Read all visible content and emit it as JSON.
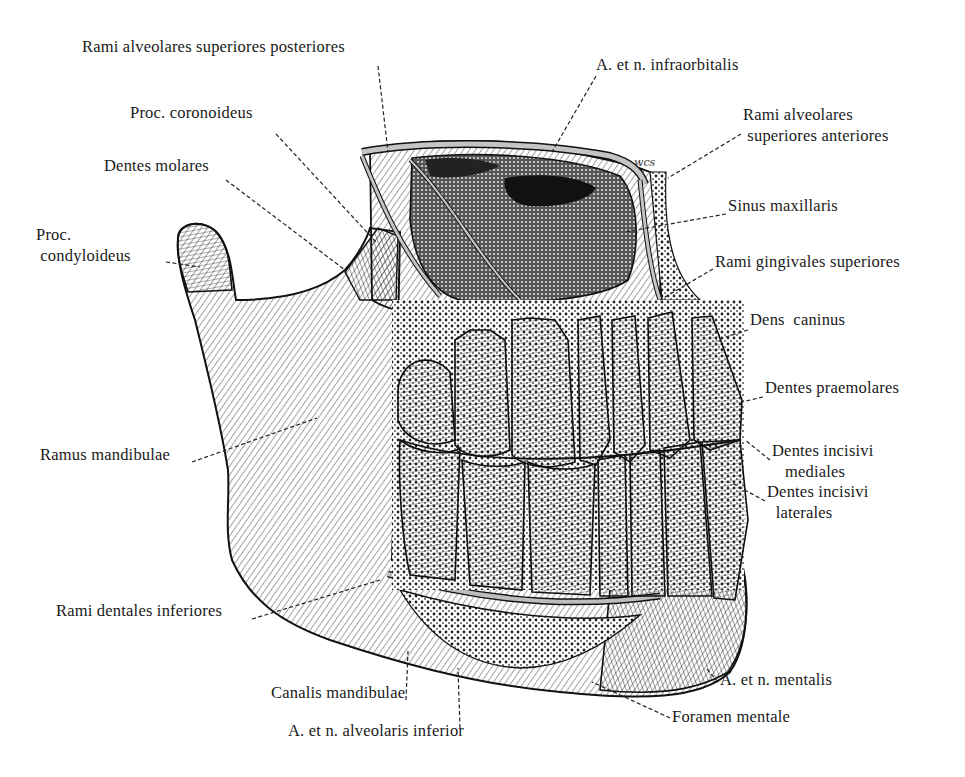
{
  "figure": {
    "signature": "wcs",
    "colors": {
      "ink": "#1a1a1a",
      "background": "#ffffff",
      "vessel_fill": "#bdbdbd",
      "bone_dark": "#2a2a2a"
    }
  },
  "labels": [
    {
      "id": "rami-alveolares-superiores-posteriores",
      "text": "Rami alveolares superiores posteriores",
      "x": 82,
      "y": 44,
      "lx1": 378,
      "ly1": 66,
      "lx2": 388,
      "ly2": 152
    },
    {
      "id": "a-et-n-infraorbitalis",
      "text": "A. et n. infraorbitalis",
      "x": 596,
      "y": 62,
      "lx1": 596,
      "ly1": 76,
      "lx2": 552,
      "ly2": 152
    },
    {
      "id": "proc-coronoideus",
      "text": "Proc. coronoideus",
      "x": 130,
      "y": 110,
      "lx1": 276,
      "ly1": 134,
      "lx2": 376,
      "ly2": 242
    },
    {
      "id": "rami-alveolares-superiores-anteriores",
      "text": "Rami alveolares\n superiores anteriores",
      "x": 743,
      "y": 112,
      "lx1": 741,
      "ly1": 134,
      "lx2": 668,
      "ly2": 178
    },
    {
      "id": "dentes-molares",
      "text": "Dentes molares",
      "x": 104,
      "y": 163,
      "lx1": 226,
      "ly1": 180,
      "lx2": 345,
      "ly2": 270
    },
    {
      "id": "sinus-maxillaris",
      "text": "Sinus maxillaris",
      "x": 728,
      "y": 203,
      "lx1": 726,
      "ly1": 214,
      "lx2": 625,
      "ly2": 232
    },
    {
      "id": "proc-condyloideus",
      "text": "Proc.\n condyloideus",
      "x": 36,
      "y": 232,
      "lx1": 166,
      "ly1": 262,
      "lx2": 200,
      "ly2": 267
    },
    {
      "id": "rami-gingivales-superiores",
      "text": "Rami gingivales superiores",
      "x": 715,
      "y": 259,
      "lx1": 713,
      "ly1": 269,
      "lx2": 660,
      "ly2": 300
    },
    {
      "id": "dens-caninus",
      "text": "Dens  caninus",
      "x": 750,
      "y": 317,
      "lx1": 748,
      "ly1": 330,
      "lx2": 716,
      "ly2": 340
    },
    {
      "id": "dentes-praemolares",
      "text": "Dentes praemolares",
      "x": 765,
      "y": 385,
      "lx1": 763,
      "ly1": 397,
      "lx2": 742,
      "ly2": 402
    },
    {
      "id": "ramus-mandibulae",
      "text": "Ramus mandibulae",
      "x": 40,
      "y": 452,
      "lx1": 192,
      "ly1": 462,
      "lx2": 317,
      "ly2": 418
    },
    {
      "id": "dentes-incisivi-mediales",
      "text": "Dentes incisivi\n   mediales",
      "x": 772,
      "y": 448,
      "lx1": 770,
      "ly1": 460,
      "lx2": 745,
      "ly2": 440
    },
    {
      "id": "dentes-incisivi-laterales",
      "text": "Dentes incisivi\n  laterales",
      "x": 767,
      "y": 489,
      "lx1": 765,
      "ly1": 501,
      "lx2": 730,
      "ly2": 482
    },
    {
      "id": "rami-dentales-inferiores",
      "text": "Rami dentales inferiores",
      "x": 56,
      "y": 608,
      "lx1": 252,
      "ly1": 619,
      "lx2": 380,
      "ly2": 580
    },
    {
      "id": "canalis-mandibulae",
      "text": "Canalis mandibulae",
      "x": 271,
      "y": 690,
      "lx1": 406,
      "ly1": 700,
      "lx2": 408,
      "ly2": 651
    },
    {
      "id": "a-et-n-mentalis",
      "text": "A. et n. mentalis",
      "x": 720,
      "y": 677,
      "lx1": 718,
      "ly1": 682,
      "lx2": 706,
      "ly2": 668
    },
    {
      "id": "foramen-mentale",
      "text": "Foramen mentale",
      "x": 672,
      "y": 714,
      "lx1": 670,
      "ly1": 718,
      "lx2": 592,
      "ly2": 682
    },
    {
      "id": "a-et-n-alveolaris-inferior",
      "text": "A. et n. alveolaris inferior",
      "x": 288,
      "y": 728,
      "lx1": 460,
      "ly1": 728,
      "lx2": 458,
      "ly2": 668
    }
  ]
}
